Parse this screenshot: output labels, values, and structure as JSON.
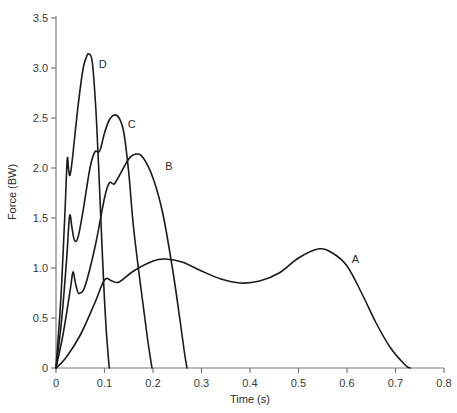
{
  "chart_data": {
    "type": "line",
    "title": "",
    "xlabel": "Time (s)",
    "ylabel": "Force (BW)",
    "xlim": [
      0,
      0.8
    ],
    "ylim": [
      0,
      3.5
    ],
    "grid": false,
    "legend": "none (curves labeled inline A, B, C, D)",
    "x_ticks": [
      "0",
      "0.1",
      "0.2",
      "0.3",
      "0.4",
      "0.5",
      "0.6",
      "0.7",
      "0.8"
    ],
    "y_ticks": [
      "0",
      "0.5",
      "1.0",
      "1.5",
      "2.0",
      "2.5",
      "3.0",
      "3.5"
    ],
    "series": [
      {
        "name": "A",
        "label_pos": [
          0.61,
          1.05
        ],
        "points": [
          [
            0,
            0
          ],
          [
            0.02,
            0.1
          ],
          [
            0.05,
            0.33
          ],
          [
            0.08,
            0.65
          ],
          [
            0.1,
            0.88
          ],
          [
            0.115,
            0.87
          ],
          [
            0.13,
            0.86
          ],
          [
            0.16,
            0.97
          ],
          [
            0.2,
            1.07
          ],
          [
            0.225,
            1.09
          ],
          [
            0.26,
            1.06
          ],
          [
            0.3,
            0.97
          ],
          [
            0.34,
            0.89
          ],
          [
            0.38,
            0.85
          ],
          [
            0.42,
            0.87
          ],
          [
            0.46,
            0.95
          ],
          [
            0.5,
            1.1
          ],
          [
            0.54,
            1.19
          ],
          [
            0.57,
            1.15
          ],
          [
            0.6,
            1.02
          ],
          [
            0.63,
            0.75
          ],
          [
            0.66,
            0.45
          ],
          [
            0.69,
            0.2
          ],
          [
            0.72,
            0.03
          ],
          [
            0.73,
            0
          ]
        ]
      },
      {
        "name": "B",
        "label_pos": [
          0.225,
          1.98
        ],
        "points": [
          [
            0,
            0
          ],
          [
            0.015,
            0.35
          ],
          [
            0.03,
            0.8
          ],
          [
            0.035,
            0.96
          ],
          [
            0.04,
            0.85
          ],
          [
            0.045,
            0.76
          ],
          [
            0.05,
            0.75
          ],
          [
            0.06,
            0.82
          ],
          [
            0.08,
            1.2
          ],
          [
            0.1,
            1.7
          ],
          [
            0.11,
            1.85
          ],
          [
            0.12,
            1.84
          ],
          [
            0.13,
            1.92
          ],
          [
            0.15,
            2.09
          ],
          [
            0.165,
            2.14
          ],
          [
            0.18,
            2.1
          ],
          [
            0.2,
            1.9
          ],
          [
            0.22,
            1.55
          ],
          [
            0.24,
            1.0
          ],
          [
            0.255,
            0.5
          ],
          [
            0.265,
            0.15
          ],
          [
            0.27,
            0
          ]
        ]
      },
      {
        "name": "C",
        "label_pos": [
          0.148,
          2.4
        ],
        "points": [
          [
            0,
            0
          ],
          [
            0.012,
            0.5
          ],
          [
            0.022,
            1.1
          ],
          [
            0.028,
            1.52
          ],
          [
            0.033,
            1.4
          ],
          [
            0.038,
            1.28
          ],
          [
            0.045,
            1.3
          ],
          [
            0.055,
            1.55
          ],
          [
            0.07,
            2.0
          ],
          [
            0.08,
            2.16
          ],
          [
            0.09,
            2.17
          ],
          [
            0.1,
            2.35
          ],
          [
            0.11,
            2.48
          ],
          [
            0.12,
            2.53
          ],
          [
            0.13,
            2.5
          ],
          [
            0.14,
            2.35
          ],
          [
            0.15,
            1.95
          ],
          [
            0.16,
            1.4
          ],
          [
            0.175,
            0.8
          ],
          [
            0.19,
            0.25
          ],
          [
            0.198,
            0
          ]
        ]
      },
      {
        "name": "D",
        "label_pos": [
          0.088,
          3.0
        ],
        "points": [
          [
            0,
            0
          ],
          [
            0.01,
            0.7
          ],
          [
            0.018,
            1.5
          ],
          [
            0.023,
            2.08
          ],
          [
            0.026,
            1.98
          ],
          [
            0.029,
            1.93
          ],
          [
            0.034,
            2.1
          ],
          [
            0.045,
            2.6
          ],
          [
            0.055,
            2.97
          ],
          [
            0.062,
            3.1
          ],
          [
            0.068,
            3.14
          ],
          [
            0.075,
            3.05
          ],
          [
            0.082,
            2.6
          ],
          [
            0.088,
            2.0
          ],
          [
            0.095,
            1.2
          ],
          [
            0.102,
            0.5
          ],
          [
            0.108,
            0.1
          ],
          [
            0.11,
            0
          ]
        ]
      }
    ]
  }
}
